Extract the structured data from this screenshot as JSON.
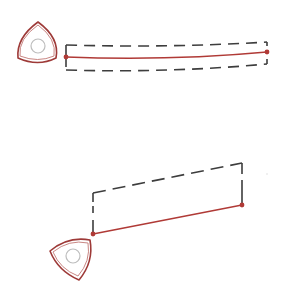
{
  "colors": {
    "background": "#ffffff",
    "accent_red": "#b03a36",
    "rotor_outer": "#9e3a38",
    "rotor_inner": "#c98784",
    "hub_circle": "#bdbdbd",
    "dashed": "#3d3d3d"
  },
  "diagrams": [
    {
      "name": "top",
      "rotor": {
        "cx": 38,
        "cy": 46,
        "size": 22,
        "rotation": 0,
        "hub_radius": 7
      },
      "red_line": {
        "x1": 66,
        "y1": 57,
        "x2": 267,
        "y2": 52,
        "curve": 4
      },
      "dashed_outline": {
        "top_y_start": 45,
        "top_y_end": 42,
        "bottom_y_start": 70,
        "bottom_y_end": 64,
        "x_start": 66,
        "x_end": 267
      }
    },
    {
      "name": "bottom",
      "rotor": {
        "cx": 73,
        "cy": 256,
        "size": 22,
        "rotation": 20,
        "hub_radius": 7
      },
      "red_line": {
        "x1": 93,
        "y1": 234,
        "x2": 242,
        "y2": 205
      },
      "dashed_outline": {
        "x_start": 93,
        "y_start": 193,
        "x_end": 242,
        "y_end": 163
      }
    }
  ],
  "labels": {
    "top_title": "Rotor with curved arm",
    "bottom_title": "Rotor with straight arm"
  }
}
